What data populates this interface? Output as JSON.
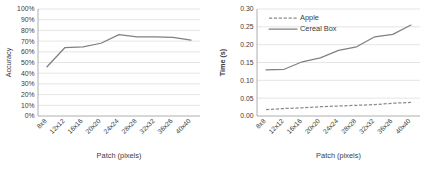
{
  "chart_data": [
    {
      "type": "line",
      "panel": "left",
      "title": "",
      "xlabel": "Patch (pixels)",
      "ylabel": "Accuracy",
      "categories": [
        "8x8",
        "12x12",
        "16x16",
        "20x20",
        "24x24",
        "28x28",
        "32x32",
        "36x26",
        "40x40"
      ],
      "ytick_labels": [
        "0%",
        "10%",
        "20%",
        "30%",
        "40%",
        "50%",
        "60%",
        "70%",
        "80%",
        "90%",
        "100%"
      ],
      "ytick_values": [
        0,
        10,
        20,
        30,
        40,
        50,
        60,
        70,
        80,
        90,
        100
      ],
      "ylim": [
        0,
        100
      ],
      "grid": true,
      "legend": "none",
      "series": [
        {
          "name": "Accuracy",
          "style": "solid",
          "color": "#808080",
          "values": [
            46,
            64,
            64.5,
            68,
            76,
            74,
            74,
            73.5,
            71
          ]
        }
      ]
    },
    {
      "type": "line",
      "panel": "right",
      "title": "",
      "xlabel": "Patch (pixels)",
      "ylabel": "Time (s)",
      "categories": [
        "8x8",
        "12x12",
        "16x16",
        "20x20",
        "24x24",
        "28x28",
        "32x32",
        "36x26",
        "40x40"
      ],
      "ytick_labels": [
        "0.00",
        "0.05",
        "0.10",
        "0.15",
        "0.20",
        "0.25",
        "0.30"
      ],
      "ytick_values": [
        0.0,
        0.05,
        0.1,
        0.15,
        0.2,
        0.25,
        0.3
      ],
      "ylim": [
        0.0,
        0.3
      ],
      "grid": true,
      "legend": "top-left-inside",
      "series": [
        {
          "name": "Apple",
          "style": "dashed",
          "color": "#8a8a8a",
          "values": [
            0.018,
            0.021,
            0.023,
            0.026,
            0.028,
            0.03,
            0.032,
            0.036,
            0.038
          ]
        },
        {
          "name": "Cereal Box",
          "style": "solid",
          "color": "#808080",
          "values": [
            0.129,
            0.131,
            0.152,
            0.163,
            0.184,
            0.194,
            0.222,
            0.229,
            0.255
          ]
        }
      ]
    }
  ]
}
